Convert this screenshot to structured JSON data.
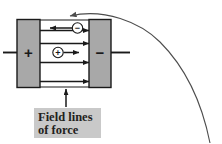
{
  "figure": {
    "background_color": "#ffffff",
    "width": 222,
    "height": 144
  },
  "colors": {
    "plate_fill": "#a8a8a8",
    "plate_stroke": "#1a1a1a",
    "line": "#1a1a1a",
    "curve": "#4d4d4d",
    "callout_box": "#c9c9c9",
    "text": "#231f20"
  },
  "capacitor": {
    "left_plate": {
      "label": "+",
      "name": "positive-plate"
    },
    "right_plate": {
      "label": "−",
      "name": "negative-plate"
    },
    "leads": [
      {
        "name": "left-lead-wire"
      },
      {
        "name": "right-lead-wire"
      }
    ]
  },
  "field_lines": {
    "count": 4,
    "direction": "left-to-right",
    "arrow_label": "field-line-arrow"
  },
  "charges": [
    {
      "name": "negative-charge",
      "symbol": "−",
      "force_direction": "left",
      "description": "negative test charge experiences force toward positive plate"
    },
    {
      "name": "positive-charge",
      "symbol": "+",
      "force_direction": "right",
      "description": "positive test charge experiences force toward negative plate"
    }
  ],
  "callout": {
    "line1": "Field lines",
    "line2": "of force",
    "pointer": "arrow pointing up to bottom field line"
  },
  "trajectory_curve": {
    "name": "incoming-trajectory-curve",
    "description": "curved path entering from lower right, arcing over the top and arrowing down into the capacitor gap"
  }
}
